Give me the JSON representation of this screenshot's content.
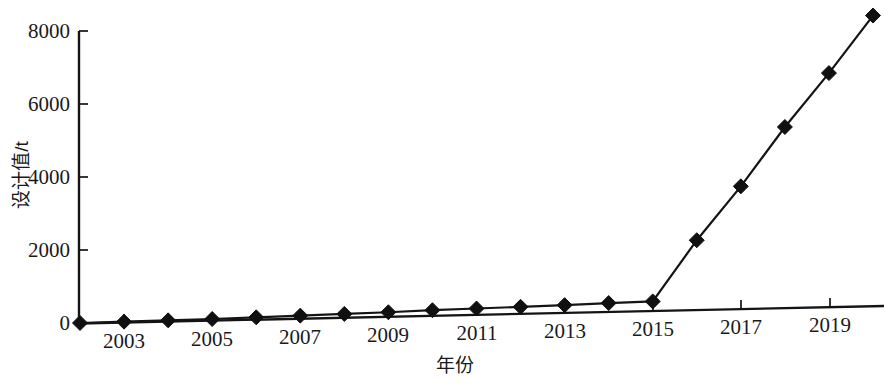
{
  "chart_data": {
    "type": "line",
    "title": "",
    "xlabel": "年份",
    "ylabel": "设计值/t",
    "xlim": [
      2002,
      2020
    ],
    "ylim": [
      0,
      8000
    ],
    "grid": false,
    "legend": null,
    "x": [
      2002,
      2003,
      2004,
      2005,
      2006,
      2007,
      2008,
      2009,
      2010,
      2011,
      2012,
      2013,
      2014,
      2015,
      2016,
      2017,
      2018,
      2019,
      2020
    ],
    "values": [
      0,
      10,
      20,
      30,
      50,
      70,
      90,
      110,
      140,
      160,
      180,
      200,
      230,
      250,
      1900,
      3350,
      4950,
      6400,
      7950
    ],
    "series": [
      {
        "name": "设计值",
        "values": [
          0,
          10,
          20,
          30,
          50,
          70,
          90,
          110,
          140,
          160,
          180,
          200,
          230,
          250,
          1900,
          3350,
          4950,
          6400,
          7950
        ]
      }
    ],
    "ytick_labels": [
      "0",
      "2000",
      "4000",
      "6000",
      "8000"
    ],
    "ytick_values": [
      0,
      2000,
      4000,
      6000,
      8000
    ],
    "xtick_labels": [
      "2003",
      "2005",
      "2007",
      "2009",
      "2011",
      "2013",
      "2015",
      "2017",
      "2019"
    ],
    "xtick_values": [
      2003,
      2005,
      2007,
      2009,
      2011,
      2013,
      2015,
      2017,
      2019
    ],
    "marker": "diamond",
    "line_color": "#141414",
    "marker_color": "#101010",
    "background_color": "#ffffff"
  },
  "axes": {
    "y_title": "设计值/t",
    "x_title": "年份"
  }
}
